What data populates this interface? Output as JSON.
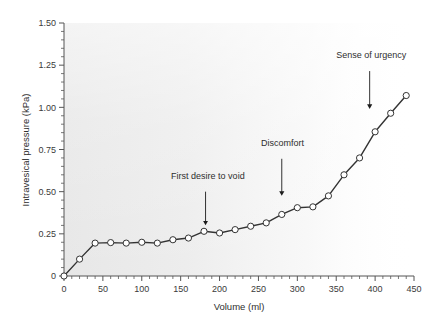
{
  "chart_data": {
    "type": "line",
    "title": "",
    "xlabel": "Volume (ml)",
    "ylabel": "Intravesical pressure (kPa)",
    "xlim": [
      0,
      450
    ],
    "ylim": [
      0,
      1.5
    ],
    "grid": false,
    "legend": "none",
    "x_major_ticks": [
      0,
      50,
      100,
      150,
      200,
      250,
      300,
      350,
      400,
      450
    ],
    "x_tick_labels": [
      "0",
      "50",
      "100",
      "150",
      "200",
      "250",
      "300",
      "350",
      "400",
      "450"
    ],
    "x_minor_tick_step": 10,
    "y_major_ticks": [
      0,
      0.25,
      0.5,
      0.75,
      1.0,
      1.25,
      1.5
    ],
    "y_tick_labels": [
      "0",
      "0.25",
      "0.50",
      "0.75",
      "1.00",
      "1.25",
      "1.50"
    ],
    "y_minor_tick_step": 0.05,
    "marker": "open-circle",
    "line_color": "#333333",
    "marker_fill": "#ffffff",
    "marker_stroke": "#333333",
    "plot_background": "#ebebeb",
    "x": [
      0,
      20,
      40,
      60,
      80,
      100,
      120,
      140,
      160,
      180,
      200,
      220,
      240,
      260,
      280,
      300,
      320,
      340,
      360,
      380,
      400,
      420,
      440
    ],
    "y": [
      0.0,
      0.1,
      0.195,
      0.198,
      0.195,
      0.2,
      0.195,
      0.215,
      0.225,
      0.265,
      0.255,
      0.275,
      0.295,
      0.315,
      0.365,
      0.405,
      0.41,
      0.475,
      0.6,
      0.7,
      0.855,
      0.965,
      1.07
    ],
    "annotations": [
      {
        "label": "First desire to void",
        "text_x": 185,
        "text_y": 0.575,
        "arrow_x": 182,
        "arrow_from_y": 0.5,
        "arrow_to_y": 0.315
      },
      {
        "label": "Discomfort",
        "text_x": 281,
        "text_y": 0.77,
        "arrow_x": 280,
        "arrow_from_y": 0.695,
        "arrow_to_y": 0.49
      },
      {
        "label": "Sense of urgency",
        "text_x": 395,
        "text_y": 1.295,
        "arrow_x": 393,
        "arrow_from_y": 1.215,
        "arrow_to_y": 1.005
      }
    ]
  }
}
